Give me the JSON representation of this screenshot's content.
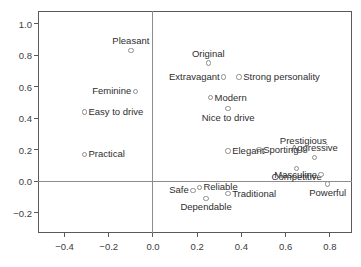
{
  "chart_data": {
    "type": "scatter",
    "title": "",
    "xlabel": "",
    "ylabel": "",
    "xlim": [
      -0.52,
      0.9
    ],
    "ylim": [
      -0.33,
      1.08
    ],
    "grid": false,
    "legend": "none",
    "reference_lines": [
      {
        "axis": "horizontal",
        "value": 0.0
      },
      {
        "axis": "vertical",
        "value": 0.0
      }
    ],
    "xticks": [
      -0.4,
      -0.2,
      0.0,
      0.2,
      0.4,
      0.6,
      0.8
    ],
    "xticklabels": [
      "-0.4",
      "-0.2",
      "0.0",
      "0.2",
      "0.4",
      "0.6",
      "0.8"
    ],
    "yticks": [
      -0.2,
      0.0,
      0.2,
      0.4,
      0.6,
      0.8,
      1.0
    ],
    "yticklabels": [
      "-0.2",
      "0.0",
      "0.2",
      "0.4",
      "0.6",
      "0.8",
      "1.0"
    ],
    "points": [
      {
        "label": "Pleasant",
        "x": -0.1,
        "y": 0.83,
        "label_pos": "above"
      },
      {
        "label": "Feminine",
        "x": -0.08,
        "y": 0.57,
        "label_pos": "left"
      },
      {
        "label": "Easy to drive",
        "x": -0.31,
        "y": 0.44,
        "label_pos": "right"
      },
      {
        "label": "Practical",
        "x": -0.31,
        "y": 0.17,
        "label_pos": "right"
      },
      {
        "label": "Original",
        "x": 0.25,
        "y": 0.75,
        "label_pos": "above"
      },
      {
        "label": "Extravagant",
        "x": 0.32,
        "y": 0.66,
        "label_pos": "left"
      },
      {
        "label": "Strong personality",
        "x": 0.39,
        "y": 0.66,
        "label_pos": "right"
      },
      {
        "label": "Modern",
        "x": 0.26,
        "y": 0.53,
        "label_pos": "right"
      },
      {
        "label": "Nice to drive",
        "x": 0.34,
        "y": 0.46,
        "label_pos": "below"
      },
      {
        "label": "Prestigious",
        "x": 0.68,
        "y": 0.2,
        "label_pos": "above"
      },
      {
        "label": "Aggressive",
        "x": 0.73,
        "y": 0.15,
        "label_pos": "above"
      },
      {
        "label": "Sporting",
        "x": 0.48,
        "y": 0.2,
        "label_pos": "right"
      },
      {
        "label": "Elegant",
        "x": 0.34,
        "y": 0.19,
        "label_pos": "right"
      },
      {
        "label": "Competitive",
        "x": 0.65,
        "y": 0.08,
        "label_pos": "below"
      },
      {
        "label": "Masculine",
        "x": 0.76,
        "y": 0.04,
        "label_pos": "left"
      },
      {
        "label": "Safe",
        "x": 0.18,
        "y": -0.06,
        "label_pos": "left"
      },
      {
        "label": "Reliable",
        "x": 0.21,
        "y": -0.04,
        "label_pos": "right"
      },
      {
        "label": "Traditional",
        "x": 0.34,
        "y": -0.08,
        "label_pos": "right"
      },
      {
        "label": "Dependable",
        "x": 0.24,
        "y": -0.11,
        "label_pos": "below"
      },
      {
        "label": "Powerful",
        "x": 0.79,
        "y": -0.02,
        "label_pos": "below"
      }
    ],
    "marker_color": "#8e8e8e",
    "text_color": "#2e2e2e",
    "frame_color": "#5a5a5a"
  }
}
